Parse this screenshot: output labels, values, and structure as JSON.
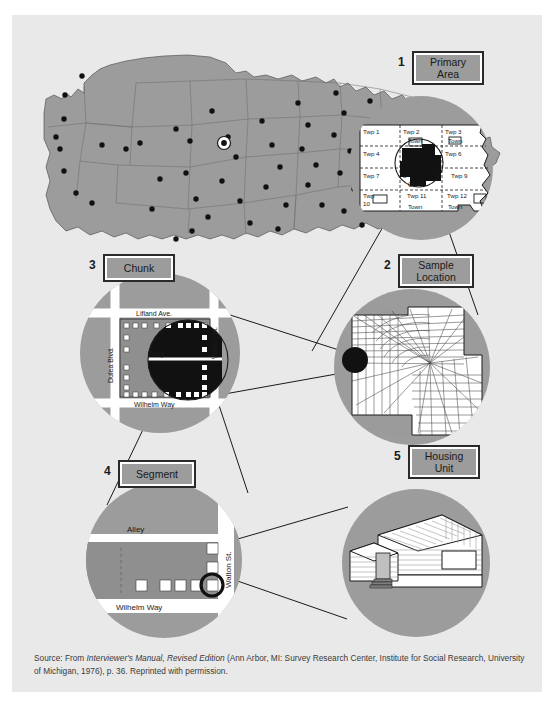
{
  "figure": {
    "colors": {
      "page_bg": "#e9e9e9",
      "circle_gray": "#9c9c9c",
      "land_gray": "#9c9c9c",
      "black": "#111111",
      "white": "#ffffff",
      "line": "#1a1a1a"
    }
  },
  "stages": [
    {
      "number": "1",
      "label_line1": "Primary",
      "label_line2": "Area",
      "name": "primary-area"
    },
    {
      "number": "2",
      "label_line1": "Sample",
      "label_line2": "Location",
      "name": "sample-location"
    },
    {
      "number": "3",
      "label_line1": "Chunk",
      "label_line2": "",
      "name": "chunk"
    },
    {
      "number": "4",
      "label_line1": "Segment",
      "label_line2": "",
      "name": "segment"
    },
    {
      "number": "5",
      "label_line1": "Housing",
      "label_line2": "Unit",
      "name": "housing-unit"
    }
  ],
  "primary_area": {
    "township_labels": [
      "Twp 1",
      "Twp 2",
      "Twp 3",
      "Twp 4",
      "Twp 5",
      "Twp 6",
      "Twp 7",
      "Twp 8",
      "Twp 9",
      "Twp 10",
      "Twp 11",
      "Twp 12"
    ],
    "town_labels": [
      "Town",
      "Town",
      "Town",
      "Town"
    ],
    "city_label": "CITY"
  },
  "chunk": {
    "streets": {
      "top": "Lifland Ave.",
      "middle": "Alley",
      "bottom": "Wilhelm Way",
      "left": "Dulea Blvd.",
      "right": "Walton St."
    }
  },
  "segment": {
    "streets": {
      "top": "Alley",
      "bottom": "Wilhelm Way",
      "right": "Walton St."
    }
  },
  "us_map": {
    "sampled_point_count": 68,
    "highlighted_point": "circled dot in Tennessee / mid-south region"
  },
  "caption": {
    "prefix": "Source: From ",
    "italic1": "Interviewer's Manual, Revised Edition",
    "rest": " (Ann Arbor, MI: Survey Research Center, Institute for Social Research, University of Michigan, 1976), p. 36. Reprinted with permission."
  }
}
